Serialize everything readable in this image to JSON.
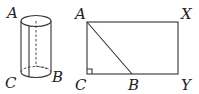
{
  "figures": {
    "cylinder": {
      "labels": {
        "top": "A",
        "bottom_left": "C",
        "bottom_right": "B"
      }
    },
    "rectangle": {
      "labels": {
        "top_left": "A",
        "top_right": "X",
        "bottom_left": "C",
        "bottom_middle": "B",
        "bottom_right": "Y"
      },
      "right_angle_at": "C"
    }
  },
  "colors": {
    "stroke": "#333333",
    "background": "#ffffff"
  }
}
